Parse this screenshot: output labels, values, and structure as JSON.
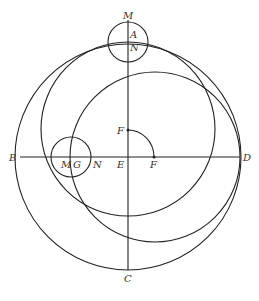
{
  "diagram": {
    "stroke_color": "#222222",
    "labels": {
      "M_top": "M",
      "A": "A",
      "N_top": "N",
      "F_upper": "F",
      "B": "B",
      "M_left": "M",
      "G": "G",
      "N_left": "N",
      "E": "E",
      "F_lower": "F",
      "D": "D",
      "C": "C"
    },
    "circles": [
      {
        "name": "main-circle",
        "center": "E",
        "cx": 128,
        "cy": 157,
        "r": 113
      },
      {
        "name": "upper-offset-circle",
        "cx": 128,
        "cy": 129,
        "r": 87
      },
      {
        "name": "right-offset-circle",
        "cx": 155,
        "cy": 157,
        "r": 86
      },
      {
        "name": "small-top-circle",
        "cx": 128,
        "cy": 42,
        "r": 20
      },
      {
        "name": "small-left-circle",
        "cx": 71,
        "cy": 157,
        "r": 20
      }
    ],
    "lines": [
      {
        "name": "vertical-diameter",
        "from": "M",
        "to": "C"
      },
      {
        "name": "horizontal-diameter",
        "from": "B",
        "to": "D"
      }
    ],
    "arc": {
      "name": "quarter-arc-FF",
      "center": "E",
      "from": "F (upper)",
      "to": "F (lower)"
    }
  }
}
